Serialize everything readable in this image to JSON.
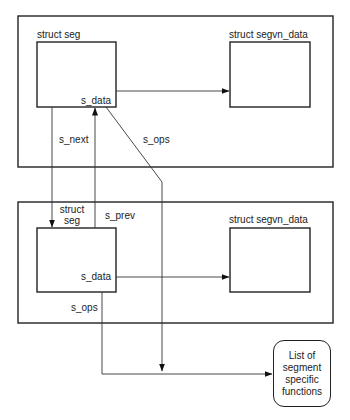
{
  "diagram": {
    "type": "memory-structure-diagram",
    "groups": [
      {
        "id": "segment-1",
        "seg": {
          "label": "struct seg",
          "field_data": "s_data"
        },
        "segvn": {
          "label": "struct segvn_data"
        }
      },
      {
        "id": "segment-2",
        "seg": {
          "label_line1": "struct",
          "label_line2": "seg",
          "field_data": "s_data"
        },
        "segvn": {
          "label": "struct segvn_data"
        }
      }
    ],
    "links": {
      "s_next": "s_next",
      "s_prev": "s_prev",
      "s_ops_top": "s_ops",
      "s_ops_bottom": "s_ops"
    },
    "functions_box": {
      "line1": "List of",
      "line2": "segment",
      "line3": "specific",
      "line4": "functions"
    },
    "colors": {
      "stroke": "#222222",
      "background": "#ffffff"
    }
  }
}
